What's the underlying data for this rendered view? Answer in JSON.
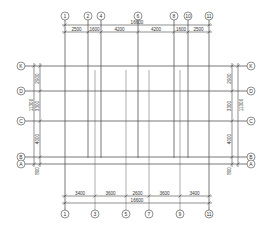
{
  "drawing": {
    "type": "structural axis grid plan",
    "top_axes": [
      {
        "label": "1",
        "x": 65
      },
      {
        "label": "2",
        "x": 88
      },
      {
        "label": "4",
        "x": 101
      },
      {
        "label": "6",
        "x": 138
      },
      {
        "label": "8",
        "x": 174
      },
      {
        "label": "10",
        "x": 188
      },
      {
        "label": "11",
        "x": 209
      }
    ],
    "bottom_axes": [
      {
        "label": "1",
        "x": 65
      },
      {
        "label": "3",
        "x": 95
      },
      {
        "label": "5",
        "x": 126
      },
      {
        "label": "7",
        "x": 149
      },
      {
        "label": "9",
        "x": 180
      },
      {
        "label": "11",
        "x": 209
      }
    ],
    "row_axes": [
      {
        "label": "K",
        "y": 66
      },
      {
        "label": "D",
        "y": 91
      },
      {
        "label": "C",
        "y": 121
      },
      {
        "label": "B",
        "y": 157
      },
      {
        "label": "A",
        "y": 164
      }
    ],
    "top_dimensions": {
      "total": "16600",
      "segments": [
        "2500",
        "1600",
        "4200",
        "4200",
        "1600",
        "2500"
      ]
    },
    "bottom_dimensions": {
      "total": "16600",
      "segments": [
        "3400",
        "3600",
        "2600",
        "3600",
        "3400"
      ]
    },
    "left_dimensions": {
      "total": "11300",
      "segments": [
        "2900",
        "3300",
        "4000",
        "800"
      ]
    },
    "right_dimensions": {
      "total": "11300",
      "segments": [
        "2900",
        "3300",
        "4000",
        "800"
      ]
    }
  }
}
